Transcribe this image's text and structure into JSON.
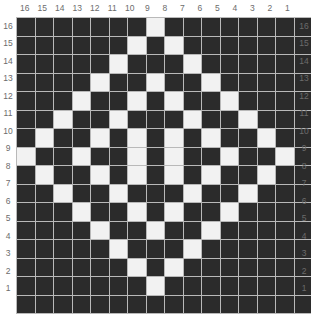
{
  "chart_data": {
    "type": "heatmap",
    "title": "",
    "xlabel": "",
    "ylabel": "",
    "rows": 16,
    "cols": 16,
    "grid_on": true,
    "legend_position": "none",
    "colors": {
      "filled": "#2b2b2b",
      "empty": "#f2f2f2",
      "gridline": "#b9b9b9",
      "label": "#6c6c6c",
      "background": "#ffffff"
    },
    "value_meaning": {
      "0": "dark square",
      "1": "light square"
    },
    "x_tick_labels_top": [
      "16",
      "15",
      "14",
      "13",
      "12",
      "11",
      "10",
      "9",
      "8",
      "7",
      "6",
      "5",
      "4",
      "3",
      "2",
      "1"
    ],
    "x_tick_labels_bottom": [
      "16",
      "15",
      "14",
      "13",
      "12",
      "11",
      "10",
      "9",
      "8",
      "7",
      "6",
      "5",
      "4",
      "3",
      "2",
      "1"
    ],
    "y_tick_labels_left": [
      "16",
      "15",
      "14",
      "13",
      "12",
      "11",
      "10",
      "9",
      "8",
      "7",
      "6",
      "5",
      "4",
      "3",
      "2",
      "1"
    ],
    "y_tick_labels_right": [
      "16",
      "15",
      "14",
      "13",
      "12",
      "11",
      "10",
      "9",
      "8",
      "7",
      "6",
      "5",
      "4",
      "3",
      "2",
      "1"
    ],
    "row_order_top_to_bottom": [
      16,
      15,
      14,
      13,
      12,
      11,
      10,
      9,
      8,
      7,
      6,
      5,
      4,
      3,
      2,
      1
    ],
    "col_order_left_to_right": [
      16,
      15,
      14,
      13,
      12,
      11,
      10,
      9,
      8,
      7,
      6,
      5,
      4,
      3,
      2,
      1
    ],
    "matrix": [
      [
        0,
        0,
        0,
        0,
        0,
        0,
        0,
        1,
        0,
        0,
        0,
        0,
        0,
        0,
        0,
        0
      ],
      [
        0,
        0,
        0,
        0,
        0,
        0,
        1,
        0,
        1,
        0,
        0,
        0,
        0,
        0,
        0,
        0
      ],
      [
        0,
        0,
        0,
        0,
        0,
        1,
        0,
        0,
        0,
        1,
        0,
        0,
        0,
        0,
        0,
        0
      ],
      [
        0,
        0,
        0,
        0,
        1,
        0,
        0,
        1,
        0,
        0,
        1,
        0,
        0,
        0,
        0,
        0
      ],
      [
        0,
        0,
        0,
        1,
        0,
        0,
        1,
        0,
        1,
        0,
        0,
        1,
        0,
        0,
        0,
        0
      ],
      [
        0,
        0,
        1,
        0,
        0,
        1,
        0,
        0,
        0,
        1,
        0,
        0,
        1,
        0,
        0,
        0
      ],
      [
        0,
        1,
        0,
        0,
        1,
        0,
        1,
        0,
        1,
        0,
        1,
        0,
        0,
        1,
        0,
        0
      ],
      [
        1,
        0,
        0,
        1,
        0,
        0,
        1,
        0,
        1,
        0,
        0,
        1,
        0,
        0,
        1,
        0
      ],
      [
        0,
        1,
        0,
        0,
        1,
        0,
        1,
        0,
        1,
        0,
        1,
        0,
        0,
        1,
        0,
        0
      ],
      [
        0,
        0,
        1,
        0,
        0,
        1,
        0,
        0,
        0,
        1,
        0,
        0,
        1,
        0,
        0,
        0
      ],
      [
        0,
        0,
        0,
        1,
        0,
        0,
        1,
        0,
        1,
        0,
        0,
        1,
        0,
        0,
        0,
        0
      ],
      [
        0,
        0,
        0,
        0,
        1,
        0,
        0,
        1,
        0,
        0,
        1,
        0,
        0,
        0,
        0,
        0
      ],
      [
        0,
        0,
        0,
        0,
        0,
        1,
        0,
        0,
        0,
        1,
        0,
        0,
        0,
        0,
        0,
        0
      ],
      [
        0,
        0,
        0,
        0,
        0,
        0,
        1,
        0,
        1,
        0,
        0,
        0,
        0,
        0,
        0,
        0
      ],
      [
        0,
        0,
        0,
        0,
        0,
        0,
        0,
        1,
        0,
        0,
        0,
        0,
        0,
        0,
        0,
        0
      ],
      [
        0,
        0,
        0,
        0,
        0,
        0,
        0,
        0,
        0,
        0,
        0,
        0,
        0,
        0,
        0,
        0
      ]
    ]
  }
}
